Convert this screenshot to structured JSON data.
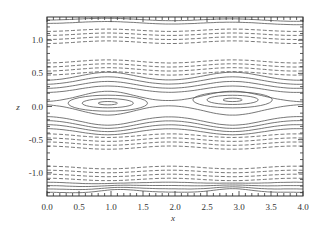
{
  "chart_data": {
    "type": "contour",
    "title": "",
    "xlabel": "x",
    "ylabel": "z",
    "xlim": [
      0.0,
      4.0
    ],
    "ylim": [
      -1.35,
      1.35
    ],
    "x_ticks": [
      "0.0",
      "0.5",
      "1.0",
      "1.5",
      "2.0",
      "2.5",
      "3.0",
      "3.5",
      "4.0"
    ],
    "y_ticks": [
      "-1.0",
      "-0.5",
      "0.0",
      "0.5",
      "1.0"
    ],
    "grid": false,
    "legend": null,
    "line_color": "#555555",
    "vortices": [
      {
        "center_x": 0.95,
        "center_z": 0.05,
        "closed_contours": 3
      },
      {
        "center_x": 2.9,
        "center_z": 0.1,
        "closed_contours": 3
      }
    ],
    "contour_bands": [
      {
        "style": "solid",
        "z_levels": [
          1.32,
          1.27
        ],
        "description": "top solid lines"
      },
      {
        "style": "dashed",
        "z_levels": [
          1.15,
          1.09,
          1.03,
          0.97
        ],
        "description": "upper dashed band"
      },
      {
        "style": "dashed",
        "z_levels": [
          0.68,
          0.62,
          0.56,
          0.5
        ],
        "description": "upper-middle dashed band"
      },
      {
        "style": "solid",
        "z_levels": [
          0.42,
          0.36,
          0.3,
          0.24
        ],
        "description": "open solid streamlines above vortices"
      },
      {
        "style": "solid",
        "z_levels": [
          -0.18,
          -0.24,
          -0.3,
          -0.36
        ],
        "description": "open solid streamlines below vortices"
      },
      {
        "style": "dashed",
        "z_levels": [
          -0.44,
          -0.5,
          -0.56,
          -0.62
        ],
        "description": "lower-middle dashed band"
      },
      {
        "style": "dashed",
        "z_levels": [
          -0.92,
          -0.98,
          -1.04,
          -1.1
        ],
        "description": "lower dashed band"
      },
      {
        "style": "solid",
        "z_levels": [
          -1.16,
          -1.21,
          -1.26,
          -1.31
        ],
        "description": "bottom solid lines with lobes"
      }
    ]
  }
}
